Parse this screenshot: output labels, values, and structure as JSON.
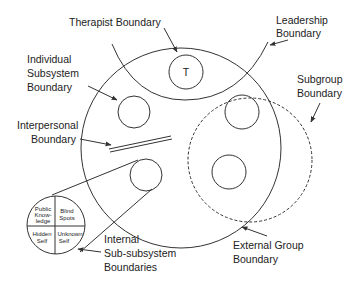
{
  "diagram": {
    "labels": {
      "therapist": "Therapist Boundary",
      "leadership_1": "Leadership",
      "leadership_2": "Boundary",
      "individual_1": "Individual",
      "individual_2": "Subsystem",
      "individual_3": "Boundary",
      "subgroup_1": "Subgroup",
      "subgroup_2": "Boundary",
      "interpersonal_1": "Interpersonal",
      "interpersonal_2": "Boundary",
      "internal_1": "Internal",
      "internal_2": "Sub-subsystem",
      "internal_3": "Boundaries",
      "external_1": "External Group",
      "external_2": "Boundary"
    },
    "therapist_symbol": "T",
    "johari": {
      "q1_a": "Public",
      "q1_b": "Know-",
      "q1_c": "ledge",
      "q2_a": "Blind",
      "q2_b": "Spots",
      "q3_a": "Hidden",
      "q3_b": "Self",
      "q4_a": "Unknown",
      "q4_b": "Self"
    }
  }
}
